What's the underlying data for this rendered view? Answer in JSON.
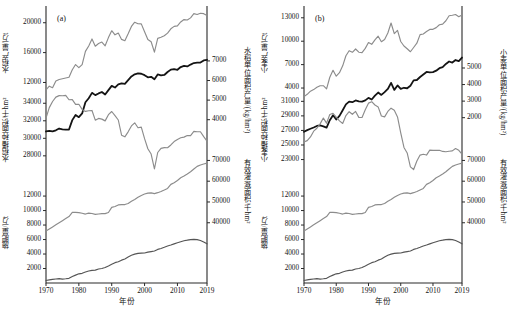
{
  "figure": {
    "caption": "",
    "xaxis": {
      "label": "年份",
      "ticks": [
        "1970",
        "1980",
        "1990",
        "2000",
        "2010",
        "2019"
      ],
      "min": 1970,
      "max": 2019
    }
  },
  "panels": [
    {
      "id": "(a)",
      "name": "rice",
      "axes": [
        {
          "key": "yield",
          "side": "left",
          "label": "水稻产量/万t",
          "ticks": [
            "12000",
            "16000",
            "20000"
          ]
        },
        {
          "key": "unit_yield",
          "side": "right",
          "label": "水稻单位面积产量/(kg/hm²)",
          "ticks": [
            "4000",
            "5000",
            "6000",
            "7000"
          ]
        },
        {
          "key": "sown_area",
          "side": "left",
          "label": "水稻播种面积/千hm²",
          "ticks": [
            "28000",
            "30000",
            "32000",
            "34000"
          ]
        },
        {
          "key": "irrigated",
          "side": "right",
          "label": "有效灌溉面积/千hm²",
          "ticks": [
            "40000",
            "50000",
            "60000",
            "70000"
          ]
        },
        {
          "key": "fertilizer",
          "side": "left",
          "label": "施肥量/万t",
          "ticks": [
            "2000",
            "4000",
            "6000",
            "8000",
            "10000",
            "12000"
          ]
        }
      ]
    },
    {
      "id": "(b)",
      "name": "wheat",
      "axes": [
        {
          "key": "yield",
          "side": "left",
          "label": "小麦产量/万t",
          "ticks": [
            "4000",
            "7000",
            "10000",
            "13000"
          ]
        },
        {
          "key": "unit_yield",
          "side": "right",
          "label": "小麦单位面积产量/(kg/hm²)",
          "ticks": [
            "2000",
            "3000",
            "4000",
            "5000"
          ]
        },
        {
          "key": "sown_area",
          "side": "left",
          "label": "小麦播种面积/千hm²",
          "ticks": [
            "23000",
            "25000",
            "27000",
            "29000",
            "31000"
          ]
        },
        {
          "key": "irrigated",
          "side": "right",
          "label": "有效灌溉面积/千hm²",
          "ticks": [
            "40000",
            "50000",
            "60000",
            "70000"
          ]
        },
        {
          "key": "fertilizer",
          "side": "left",
          "label": "施肥量/万t",
          "ticks": [
            "2000",
            "4000",
            "6000",
            "8000",
            "10000",
            "12000"
          ]
        }
      ]
    }
  ],
  "chart_data": [
    {
      "type": "line",
      "panel": "(a)",
      "title": "水稻",
      "xlabel": "年份",
      "xlim": [
        1970,
        2019
      ],
      "grid": false,
      "legend": "none",
      "x": [
        1970,
        1971,
        1972,
        1973,
        1974,
        1975,
        1976,
        1977,
        1978,
        1979,
        1980,
        1981,
        1982,
        1983,
        1984,
        1985,
        1986,
        1987,
        1988,
        1989,
        1990,
        1991,
        1992,
        1993,
        1994,
        1995,
        1996,
        1997,
        1998,
        1999,
        2000,
        2001,
        2002,
        2003,
        2004,
        2005,
        2006,
        2007,
        2008,
        2009,
        2010,
        2011,
        2012,
        2013,
        2014,
        2015,
        2016,
        2017,
        2018,
        2019
      ],
      "series": [
        {
          "name": "水稻产量/万t",
          "unit": "万t",
          "axis": "left-top",
          "color": "#8c8c8c",
          "ylim": [
            10000,
            21500
          ],
          "values": [
            11000,
            11500,
            11300,
            12200,
            12400,
            12500,
            12600,
            12700,
            13700,
            14400,
            13990,
            14400,
            16160,
            16890,
            17830,
            16860,
            17220,
            17420,
            16910,
            18010,
            18930,
            18380,
            18620,
            17770,
            17590,
            18520,
            19510,
            20070,
            19870,
            19850,
            18790,
            17758,
            17454,
            16066,
            17909,
            18059,
            18257,
            18603,
            19190,
            19510,
            19576,
            20100,
            20424,
            20361,
            20651,
            21214,
            21109,
            21268,
            21213,
            20961
          ]
        },
        {
          "name": "水稻单位面积产量/(kg/hm²)",
          "unit": "kg/hm²",
          "axis": "right-top",
          "color": "#141414",
          "ylim": [
            3300,
            7400
          ],
          "values": [
            3399,
            3430,
            3400,
            3460,
            3550,
            3510,
            3490,
            3500,
            3978,
            4244,
            4130,
            4320,
            4890,
            5098,
            5370,
            5255,
            5340,
            5413,
            5285,
            5511,
            5726,
            5640,
            5803,
            5849,
            5831,
            6024,
            6210,
            6319,
            6366,
            6346,
            6272,
            6163,
            6189,
            6061,
            6311,
            6260,
            6283,
            6433,
            6556,
            6585,
            6548,
            6687,
            6750,
            6718,
            6813,
            6892,
            6909,
            6917,
            7026,
            7059
          ]
        },
        {
          "name": "水稻播种面积/千hm²",
          "unit": "千hm²",
          "axis": "left-mid",
          "color": "#8c8c8c",
          "ylim": [
            25500,
            35300
          ],
          "values": [
            32300,
            33500,
            34200,
            34700,
            34870,
            34860,
            34900,
            34400,
            34420,
            33870,
            33880,
            33300,
            33070,
            33140,
            33180,
            32070,
            32270,
            32190,
            31990,
            32700,
            33060,
            32590,
            32090,
            30360,
            30170,
            30740,
            31410,
            31770,
            31210,
            31280,
            29962,
            28812,
            28203,
            26508,
            28379,
            28847,
            28938,
            28919,
            29241,
            29627,
            29873,
            30057,
            30137,
            30312,
            30310,
            30784,
            30746,
            30747,
            30189,
            29690
          ]
        },
        {
          "name": "有效灌溉面积/千hm²",
          "unit": "千hm²",
          "axis": "right-mid",
          "color": "#8c8c8c",
          "ylim": [
            35000,
            75000
          ],
          "values": [
            36000,
            37000,
            38000,
            39000,
            40000,
            41000,
            42000,
            43000,
            44965,
            45004,
            44888,
            44574,
            44177,
            44644,
            44453,
            44036,
            44226,
            44403,
            44376,
            44917,
            47403,
            47822,
            48590,
            48728,
            48759,
            49281,
            50381,
            51239,
            52296,
            53158,
            53820,
            54249,
            54355,
            54014,
            54478,
            55029,
            55750,
            56518,
            58472,
            59261,
            60348,
            61682,
            62491,
            63473,
            64540,
            65873,
            67141,
            67816,
            68272,
            68679
          ]
        },
        {
          "name": "施肥量/万t",
          "unit": "万t",
          "axis": "left-bot",
          "color": "#555555",
          "ylim": [
            0,
            13000
          ],
          "values": [
            351,
            424,
            502,
            551,
            602,
            536,
            583,
            648,
            884,
            1086,
            1269,
            1335,
            1513,
            1660,
            1740,
            1776,
            1931,
            1999,
            2142,
            2357,
            2590,
            2806,
            2930,
            3152,
            3318,
            3594,
            3828,
            3981,
            4084,
            4124,
            4146,
            4254,
            4339,
            4412,
            4637,
            4766,
            4928,
            5108,
            5239,
            5404,
            5562,
            5704,
            5839,
            5912,
            5996,
            6023,
            5984,
            5859,
            5653,
            5404
          ]
        }
      ]
    },
    {
      "type": "line",
      "panel": "(b)",
      "title": "小麦",
      "xlabel": "年份",
      "xlim": [
        1970,
        2019
      ],
      "grid": false,
      "legend": "none",
      "x": [
        1970,
        1971,
        1972,
        1973,
        1974,
        1975,
        1976,
        1977,
        1978,
        1979,
        1980,
        1981,
        1982,
        1983,
        1984,
        1985,
        1986,
        1987,
        1988,
        1989,
        1990,
        1991,
        1992,
        1993,
        1994,
        1995,
        1996,
        1997,
        1998,
        1999,
        2000,
        2001,
        2002,
        2003,
        2004,
        2005,
        2006,
        2007,
        2008,
        2009,
        2010,
        2011,
        2012,
        2013,
        2014,
        2015,
        2016,
        2017,
        2018,
        2019
      ],
      "series": [
        {
          "name": "小麦产量/万t",
          "unit": "万t",
          "axis": "left-top",
          "color": "#8c8c8c",
          "ylim": [
            2800,
            13800
          ],
          "values": [
            2900,
            3200,
            3600,
            3800,
            4100,
            4300,
            4300,
            3900,
            5384,
            6273,
            5521,
            5964,
            6847,
            8139,
            8782,
            8581,
            9004,
            8590,
            8543,
            9081,
            9823,
            9595,
            10159,
            10639,
            9930,
            10221,
            11057,
            12329,
            10973,
            11388,
            9964,
            9387,
            9029,
            8649,
            9195,
            9745,
            10847,
            10930,
            11246,
            11512,
            11518,
            11740,
            12102,
            12193,
            12621,
            13264,
            13319,
            13424,
            13143,
            13360
          ]
        },
        {
          "name": "小麦单位面积产量/(kg/hm²)",
          "unit": "kg/hm²",
          "axis": "right-top",
          "color": "#141414",
          "ylim": [
            1050,
            5900
          ],
          "values": [
            1150,
            1250,
            1330,
            1410,
            1500,
            1530,
            1480,
            1400,
            1845,
            2143,
            1890,
            2108,
            2449,
            2802,
            2969,
            2937,
            3041,
            2989,
            2967,
            3043,
            3194,
            3100,
            3331,
            3519,
            3374,
            3542,
            3734,
            4102,
            3680,
            3947,
            3738,
            3806,
            3777,
            3932,
            4252,
            4275,
            4455,
            4608,
            4762,
            4739,
            4748,
            4838,
            4987,
            5056,
            5246,
            5393,
            5327,
            5481,
            5416,
            5630
          ]
        },
        {
          "name": "小麦播种面积/千hm²",
          "unit": "千hm²",
          "axis": "left-mid",
          "color": "#8c8c8c",
          "ylim": [
            20500,
            32300
          ],
          "values": [
            25400,
            25600,
            26100,
            26900,
            27300,
            27900,
            28700,
            28000,
            29183,
            29357,
            28843,
            28311,
            27955,
            29052,
            29577,
            29218,
            29612,
            28798,
            28785,
            29841,
            30753,
            30948,
            30496,
            30235,
            28981,
            28860,
            29611,
            30057,
            29774,
            28855,
            26653,
            24664,
            23908,
            21997,
            21626,
            22793,
            23613,
            23721,
            23617,
            24291,
            24257,
            24270,
            24268,
            24117,
            24065,
            24141,
            24188,
            24508,
            24266,
            23730
          ]
        },
        {
          "name": "有效灌溉面积/千hm²",
          "unit": "千hm²",
          "axis": "right-mid",
          "color": "#8c8c8c",
          "ylim": [
            35000,
            75000
          ],
          "values": [
            36000,
            37000,
            38000,
            39000,
            40000,
            41000,
            42000,
            43000,
            44965,
            45004,
            44888,
            44574,
            44177,
            44644,
            44453,
            44036,
            44226,
            44403,
            44376,
            44917,
            47403,
            47822,
            48590,
            48728,
            48759,
            49281,
            50381,
            51239,
            52296,
            53158,
            53820,
            54249,
            54355,
            54014,
            54478,
            55029,
            55750,
            56518,
            58472,
            59261,
            60348,
            61682,
            62491,
            63473,
            64540,
            65873,
            67141,
            67816,
            68272,
            68679
          ]
        },
        {
          "name": "施肥量/万t",
          "unit": "万t",
          "axis": "left-bot",
          "color": "#555555",
          "ylim": [
            0,
            13000
          ],
          "values": [
            351,
            424,
            502,
            551,
            602,
            536,
            583,
            648,
            884,
            1086,
            1269,
            1335,
            1513,
            1660,
            1740,
            1776,
            1931,
            1999,
            2142,
            2357,
            2590,
            2806,
            2930,
            3152,
            3318,
            3594,
            3828,
            3981,
            4084,
            4124,
            4146,
            4254,
            4339,
            4412,
            4637,
            4766,
            4928,
            5108,
            5239,
            5404,
            5562,
            5704,
            5839,
            5912,
            5996,
            6023,
            5984,
            5859,
            5653,
            5404
          ]
        }
      ]
    }
  ]
}
